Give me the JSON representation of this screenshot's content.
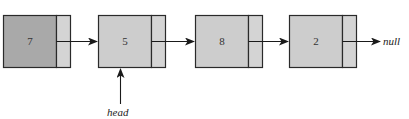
{
  "diagram": {
    "type": "singly-linked-list",
    "nodes": [
      {
        "value": "7",
        "fill": "#a9a9a9",
        "highlighted": true
      },
      {
        "value": "5",
        "fill": "#cdcdcd",
        "highlighted": false
      },
      {
        "value": "8",
        "fill": "#cdcdcd",
        "highlighted": false
      },
      {
        "value": "2",
        "fill": "#cdcdcd",
        "highlighted": false
      }
    ],
    "pointer_fill": "#d4d4d4",
    "terminator_label": "null",
    "head_label": "head",
    "head_points_to_index": 1
  }
}
